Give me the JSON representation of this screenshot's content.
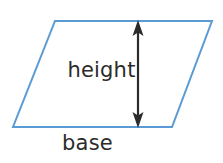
{
  "figure": {
    "type": "geometry-diagram",
    "shape": "parallelogram",
    "background_color": "#ffffff",
    "outline_color": "#5b9bd5",
    "outline_width": 2,
    "arrow_color": "#2b2b2b",
    "text_color": "#2b2b2b",
    "vertices": {
      "top_left": {
        "x": 55,
        "y": 21
      },
      "top_right": {
        "x": 212,
        "y": 21
      },
      "bottom_right": {
        "x": 172,
        "y": 127
      },
      "bottom_left": {
        "x": 13,
        "y": 127
      }
    },
    "height_arrow": {
      "x": 138,
      "y_top": 21,
      "y_bottom": 127,
      "double_headed": true
    },
    "labels": {
      "height": "height",
      "base": "base"
    }
  }
}
